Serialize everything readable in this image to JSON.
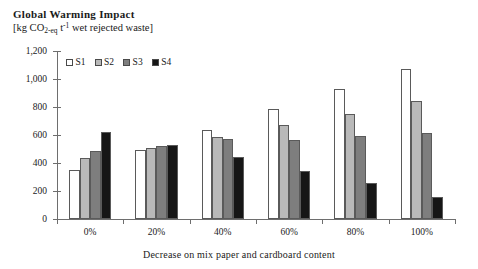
{
  "chart_data": {
    "type": "bar",
    "title": "Global Warming Impact",
    "subtitle": "[kg CO2-eq t-1 wet rejected waste]",
    "subtitle_parts": {
      "prefix": "[kg CO",
      "sub1": "2-eq",
      "mid": " t",
      "sup1": "-1",
      "suffix": " wet rejected waste]"
    },
    "xlabel": "Decrease on mix paper and cardboard content",
    "ylabel": "",
    "categories": [
      "0%",
      "20%",
      "40%",
      "60%",
      "80%",
      "100%"
    ],
    "ylim": [
      0,
      1200
    ],
    "yticks": [
      0,
      200,
      400,
      600,
      800,
      1000,
      1200
    ],
    "ytick_labels": [
      "0",
      "200",
      "400",
      "600",
      "800",
      "1,000",
      "1,200"
    ],
    "grid": false,
    "legend_position": "top-left",
    "series": [
      {
        "name": "S1",
        "color": "#ffffff",
        "values": [
          350,
          490,
          635,
          785,
          930,
          1070
        ]
      },
      {
        "name": "S2",
        "color": "#b9b9b9",
        "values": [
          435,
          505,
          588,
          672,
          752,
          845
        ]
      },
      {
        "name": "S3",
        "color": "#7e7e7e",
        "values": [
          487,
          520,
          570,
          562,
          595,
          615
        ]
      },
      {
        "name": "S4",
        "color": "#161616",
        "values": [
          620,
          530,
          440,
          345,
          255,
          160
        ]
      }
    ]
  },
  "legend": {
    "entries": [
      {
        "label": "S1",
        "color": "#ffffff"
      },
      {
        "label": "S2",
        "color": "#b9b9b9"
      },
      {
        "label": "S3",
        "color": "#7e7e7e"
      },
      {
        "label": "S4",
        "color": "#161616"
      }
    ]
  }
}
